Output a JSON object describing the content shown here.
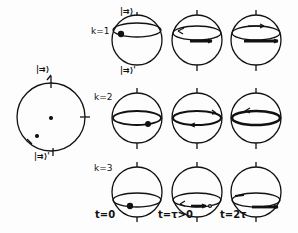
{
  "figure": {
    "left_circle": {
      "top_label": "|⇉⟩",
      "bottom_label": "|⇉⟩'"
    },
    "top_sphere_labels": {
      "north": "|⇉⟩",
      "south": "|⇉⟩'"
    },
    "rows": [
      {
        "label": "k=1"
      },
      {
        "label": "k=2"
      },
      {
        "label": "k=3"
      }
    ],
    "columns": [
      {
        "label": "t=0"
      },
      {
        "label": "t=τ>0"
      },
      {
        "label": "t=2τ"
      }
    ],
    "colors": {
      "ink": "#111111",
      "background": "#fdfdfd"
    }
  }
}
